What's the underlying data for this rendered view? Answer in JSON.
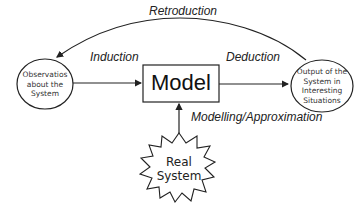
{
  "diagram": {
    "nodes": {
      "observations": {
        "label_lines": [
          "Observatios",
          "about the",
          "System"
        ],
        "shape": "ellipse"
      },
      "model": {
        "label": "Model",
        "shape": "rectangle"
      },
      "output": {
        "label_lines": [
          "Output of the",
          "System in",
          "Interesting",
          "Situations"
        ],
        "shape": "ellipse"
      },
      "real_system": {
        "label_lines": [
          "Real",
          "System"
        ],
        "shape": "star-burst"
      }
    },
    "edges": {
      "induction": {
        "label": "Induction",
        "from": "observations",
        "to": "model"
      },
      "deduction": {
        "label": "Deduction",
        "from": "model",
        "to": "output"
      },
      "retroduction": {
        "label": "Retroduction",
        "from": "output",
        "to": "observations"
      },
      "modelling": {
        "label": "Modelling/Approximation",
        "from": "real_system",
        "to": "model"
      }
    },
    "colors": {
      "stroke": "#222222",
      "text": "#222222",
      "background": "#ffffff"
    }
  }
}
